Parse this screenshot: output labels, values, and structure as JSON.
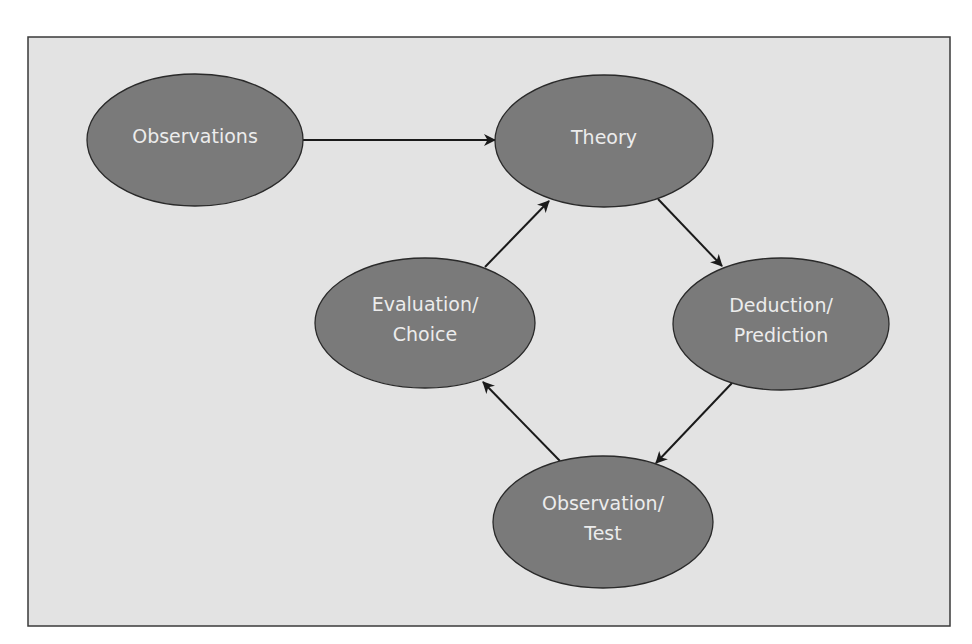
{
  "diagram": {
    "type": "flow-cycle",
    "colors": {
      "page_background": "#ffffff",
      "frame_background": "#e3e3e3",
      "frame_border": "#3a3a3a",
      "node_fill": "#7a7a7a",
      "node_stroke": "#2a2a2a",
      "node_text": "#ececec",
      "edge": "#1a1a1a"
    },
    "frame": {
      "x": 28,
      "y": 37,
      "width": 922,
      "height": 589
    },
    "nodes": [
      {
        "id": "observations",
        "lines": [
          "Observations"
        ],
        "cx": 195,
        "cy": 140,
        "rx": 108,
        "ry": 66
      },
      {
        "id": "theory",
        "lines": [
          "Theory"
        ],
        "cx": 604,
        "cy": 141,
        "rx": 109,
        "ry": 66
      },
      {
        "id": "deduction",
        "lines": [
          "Deduction/",
          "Prediction"
        ],
        "cx": 781,
        "cy": 324,
        "rx": 108,
        "ry": 66
      },
      {
        "id": "observation-test",
        "lines": [
          "Observation/",
          "Test"
        ],
        "cx": 603,
        "cy": 522,
        "rx": 110,
        "ry": 66
      },
      {
        "id": "evaluation",
        "lines": [
          "Evaluation/",
          "Choice"
        ],
        "cx": 425,
        "cy": 323,
        "rx": 110,
        "ry": 65
      }
    ],
    "edges": [
      {
        "from": "observations",
        "to": "theory",
        "x1": 303,
        "y1": 140,
        "x2": 495,
        "y2": 140
      },
      {
        "from": "theory",
        "to": "deduction",
        "x1": 658,
        "y1": 199,
        "x2": 722,
        "y2": 266
      },
      {
        "from": "deduction",
        "to": "observation-test",
        "x1": 732,
        "y1": 383,
        "x2": 656,
        "y2": 463
      },
      {
        "from": "observation-test",
        "to": "evaluation",
        "x1": 560,
        "y1": 461,
        "x2": 483,
        "y2": 382
      },
      {
        "from": "evaluation",
        "to": "theory",
        "x1": 485,
        "y1": 267,
        "x2": 549,
        "y2": 201
      }
    ]
  }
}
